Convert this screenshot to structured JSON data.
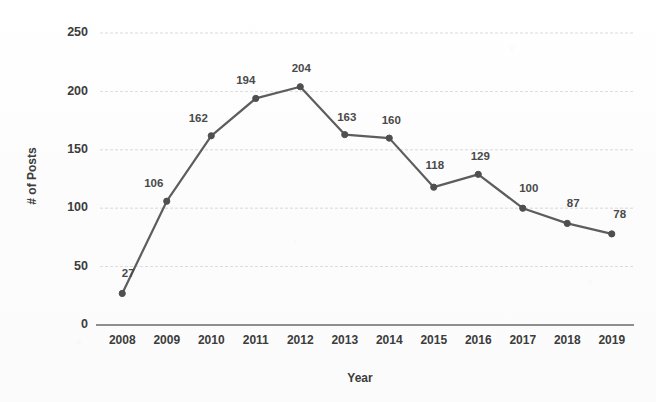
{
  "chart_data": {
    "type": "line",
    "title": "",
    "xlabel": "Year",
    "ylabel": "# of Posts",
    "categories": [
      "2008",
      "2009",
      "2010",
      "2011",
      "2012",
      "2013",
      "2014",
      "2015",
      "2016",
      "2017",
      "2018",
      "2019"
    ],
    "values": [
      27,
      106,
      162,
      194,
      204,
      163,
      160,
      118,
      129,
      100,
      87,
      78
    ],
    "point_labels": [
      "27",
      "106",
      "162",
      "194",
      "204",
      "163",
      "160",
      "118",
      "129",
      "100",
      "87",
      "78"
    ],
    "ylim": [
      0,
      250
    ],
    "ytick_labels": [
      "0",
      "50",
      "100",
      "150",
      "200",
      "250"
    ],
    "ytick_values": [
      0,
      50,
      100,
      150,
      200,
      250
    ],
    "grid": "horizontal",
    "legend": "none",
    "series_name": "# of Posts",
    "colors": {
      "line": "#5d5d5d",
      "marker": "#4f4f4f",
      "grid": "#c9c9c9",
      "axis": "#6b6b6b",
      "label_text": "#4a4a4a",
      "tick_text": "#3c3c3c",
      "background": "#fdfdfd"
    },
    "label_offsets": [
      {
        "dx": 6,
        "dy": -16
      },
      {
        "dx": -13,
        "dy": -14
      },
      {
        "dx": -13,
        "dy": -14
      },
      {
        "dx": -10,
        "dy": -14
      },
      {
        "dx": 1,
        "dy": -15
      },
      {
        "dx": 2,
        "dy": -14
      },
      {
        "dx": 2,
        "dy": -14
      },
      {
        "dx": 1,
        "dy": -18
      },
      {
        "dx": 2,
        "dy": -14
      },
      {
        "dx": 6,
        "dy": -16
      },
      {
        "dx": 6,
        "dy": -16
      },
      {
        "dx": 8,
        "dy": -16
      }
    ]
  }
}
